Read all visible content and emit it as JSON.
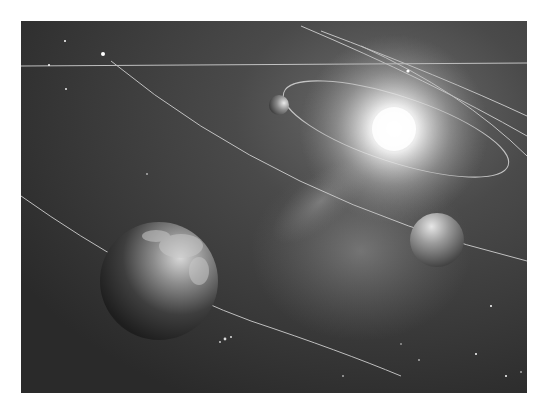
{
  "image": {
    "description": "Grayscale illustration of a solar system with orbits, a bright sun, an Earth-like planet, a mid-size planet, and a small planet against a starry nebula",
    "colors": {
      "page_background": "#ffffff",
      "space_dark": "#2a2a2a",
      "space_mid": "#4a4a4a",
      "nebula": "#8a8a8a",
      "sun_core": "#ffffff",
      "orbit_line": "#d8d8d8"
    }
  }
}
